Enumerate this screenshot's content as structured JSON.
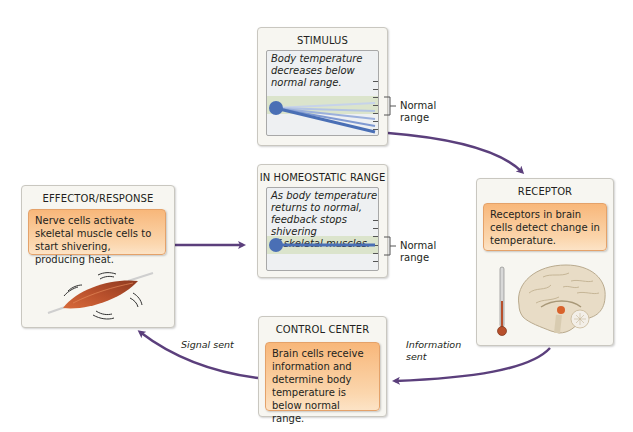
{
  "stimulus": {
    "title": "STIMULUS",
    "graph_text_lines": [
      "Body temperature",
      "decreases below",
      "normal range."
    ],
    "normal_label_lines": [
      "Normal",
      "range"
    ]
  },
  "homeostatic": {
    "title": "IN HOMEOSTATIC RANGE",
    "graph_text_lines": [
      "As body temperature",
      "returns to normal,",
      "feedback stops shivering",
      "of skeletal muscles."
    ],
    "normal_label_lines": [
      "Normal",
      "range"
    ]
  },
  "receptor": {
    "title": "RECEPTOR",
    "text": "Receptors in brain cells detect change in temperature.",
    "illustration": "brain-with-thermometer"
  },
  "control_center": {
    "title": "CONTROL CENTER",
    "text": "Brain cells receive information and determine body temperature is below normal range."
  },
  "effector": {
    "title": "EFFECTOR/RESPONSE",
    "text": "Nerve cells activate skeletal muscle cells to start shivering, producing heat.",
    "illustration": "shivering-muscle"
  },
  "arrows": {
    "information_sent_lines": [
      "Information",
      "sent"
    ],
    "signal_sent": "Signal sent"
  },
  "colors": {
    "arrow": "#5b3f7c",
    "orange_box": "#f8b77a",
    "normal_band": "#d7e2c6",
    "temperature_line": "#4a6fb5"
  }
}
